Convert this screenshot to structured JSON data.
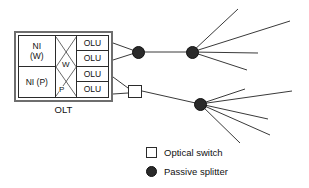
{
  "figure": {
    "type": "network-topology-diagram",
    "background_color": "#ffffff",
    "line_color": "#3a3a3a"
  },
  "olt": {
    "caption": "OLT",
    "ni_cells": [
      {
        "line1": "NI",
        "line2": "(W)"
      },
      {
        "line1": "NI (P)",
        "line2": ""
      }
    ],
    "crossbar": {
      "upper_label": "W",
      "lower_label": "P"
    },
    "olu_cells": [
      {
        "label": "OLU"
      },
      {
        "label": "OLU"
      },
      {
        "label": "OLU"
      },
      {
        "label": "OLU"
      }
    ]
  },
  "nodes": {
    "splitter_left": {
      "name": "passive-splitter-working",
      "x": 138,
      "y": 52
    },
    "splitter_upper_right": {
      "name": "passive-splitter-upper",
      "x": 192,
      "y": 52
    },
    "optical_switch": {
      "name": "optical-switch",
      "x": 135,
      "y": 91
    },
    "splitter_lower_right": {
      "name": "passive-splitter-lower",
      "x": 200,
      "y": 104
    }
  },
  "legend": {
    "items": [
      {
        "marker": "square-outline",
        "label": "Optical switch"
      },
      {
        "marker": "filled-circle",
        "label": "Passive splitter"
      }
    ]
  },
  "colors": {
    "node_fill": "#2a2a2a",
    "box_border": "#2b2b2b",
    "outer_border": "#6e6e6e",
    "text": "#111111"
  }
}
